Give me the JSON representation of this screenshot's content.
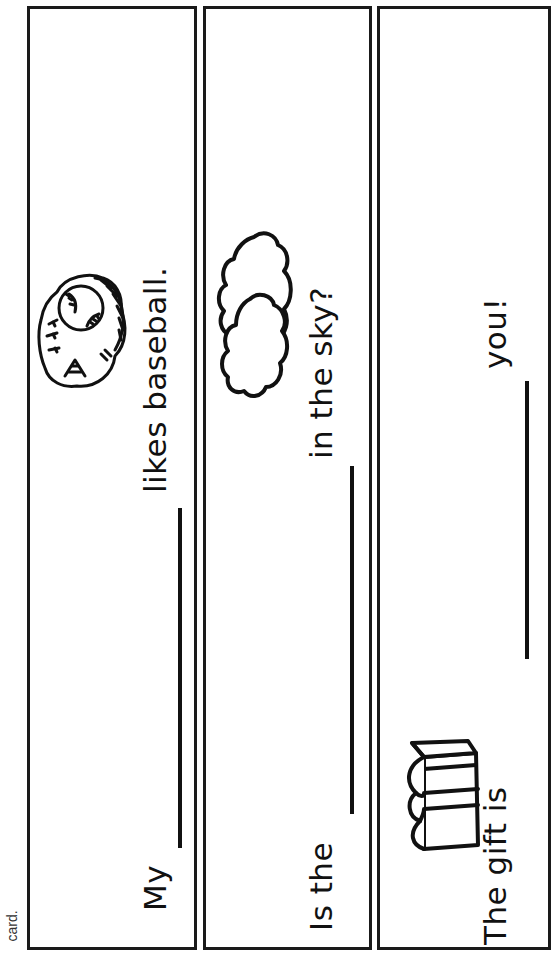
{
  "caption": "card.",
  "panels": [
    {
      "id": "panel-1",
      "before_blank": "My",
      "after_blank": "likes baseball.",
      "picture": "baseball-glove-icon"
    },
    {
      "id": "panel-2",
      "before_blank": "Is the",
      "after_blank": "in the sky?",
      "picture": "cloud-icon"
    },
    {
      "id": "panel-3",
      "before_blank": "The gift is",
      "after_blank": "you!",
      "picture": "gift-box-icon"
    }
  ],
  "colors": {
    "ink": "#111111",
    "border": "#1a1a1a",
    "paper": "#ffffff"
  }
}
